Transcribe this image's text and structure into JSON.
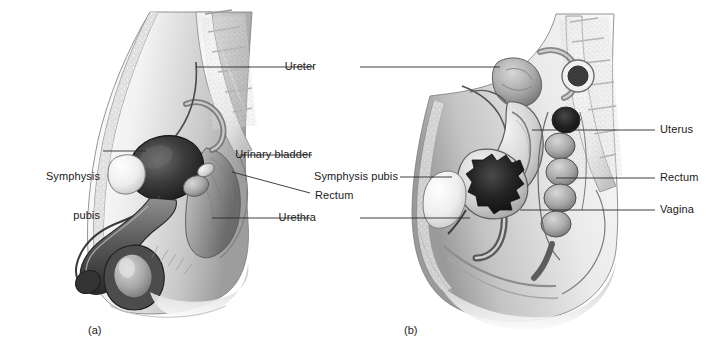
{
  "figure": {
    "background": "#ffffff",
    "ink": "#1a1a1a",
    "leader_color": "#2b2b2b",
    "panels": [
      {
        "id": "a",
        "caption": "(a)",
        "subject": "male-sagittal-section"
      },
      {
        "id": "b",
        "caption": "(b)",
        "subject": "female-sagittal-section"
      }
    ]
  },
  "labels": {
    "left": [
      {
        "id": "symphysis-pubis-male",
        "line1": "Symphysis",
        "line2": "pubis"
      }
    ],
    "center": [
      {
        "id": "ureter",
        "text": "Ureter"
      },
      {
        "id": "urinary-bladder",
        "text": "Urinary bladder"
      },
      {
        "id": "symphysis-pubis-female",
        "text": "Symphysis pubis"
      },
      {
        "id": "rectum-male",
        "text": "Rectum"
      },
      {
        "id": "urethra",
        "text": "Urethra"
      }
    ],
    "right": [
      {
        "id": "uterus",
        "text": "Uterus"
      },
      {
        "id": "rectum-female",
        "text": "Rectum"
      },
      {
        "id": "vagina",
        "text": "Vagina"
      }
    ]
  }
}
